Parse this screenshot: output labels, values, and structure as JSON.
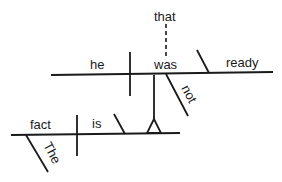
{
  "diagram": {
    "type": "sentence-diagram",
    "sentence_words": {
      "subject_clause_subject": "he",
      "subject_clause_verb": "was",
      "subject_clause_complement": "ready",
      "subject_clause_modifier": "not",
      "subject_clause_connector": "that",
      "main_subject": "fact",
      "main_verb": "is",
      "main_subject_modifier": "The"
    }
  }
}
